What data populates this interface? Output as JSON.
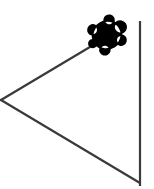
{
  "canvas": {
    "name": "turtle-graphics-canvas",
    "width": 154,
    "height": 189,
    "background_color": "#ffffff",
    "title": "Turtle Graphics Canvas"
  },
  "style": {
    "stroke_color": "#3a3a3a",
    "stroke_width": 2.2,
    "turtle_fill_color": "#000000",
    "turtle_outline_color": "#000000"
  },
  "chart_data": {
    "type": "diagram",
    "title": "Turtle Graphics Canvas",
    "xlabel": "",
    "ylabel": "",
    "xlim": [
      0,
      154
    ],
    "ylim": [
      0,
      189
    ],
    "grid": false,
    "legend": "none",
    "strokes": [
      {
        "name": "upper-left-diagonal",
        "color": "#3a3a3a",
        "width": 2.2,
        "points": [
          [
            1,
            100
          ],
          [
            100,
            41
          ]
        ]
      },
      {
        "name": "lower-left-diagonal",
        "color": "#3a3a3a",
        "width": 2.2,
        "points": [
          [
            1,
            100
          ],
          [
            140,
            183
          ]
        ]
      },
      {
        "name": "right-vertical-line",
        "color": "#3a3a3a",
        "width": 2.2,
        "points": [
          [
            140,
            21
          ],
          [
            140,
            186
          ]
        ]
      }
    ],
    "turtle": {
      "name": "turtle-cursor",
      "position": [
        107,
        35
      ],
      "heading_degrees": 31,
      "fill_color": "#000000",
      "bbox": [
        93,
        21,
        30,
        27
      ]
    },
    "vertices": [
      {
        "name": "left-apex",
        "x": 1,
        "y": 100
      },
      {
        "name": "top-right-endpoint",
        "x": 140,
        "y": 21
      },
      {
        "name": "bottom-right-corner",
        "x": 140,
        "y": 183
      }
    ]
  }
}
